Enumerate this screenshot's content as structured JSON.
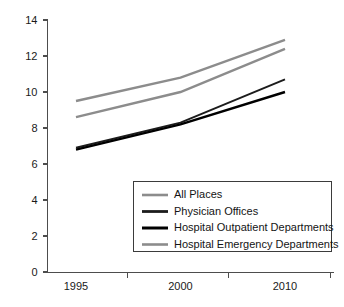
{
  "chart_data": {
    "type": "line",
    "title": "",
    "subtitle": "",
    "xlabel": "",
    "ylabel": "",
    "x": [
      "1995",
      "2000",
      "2010"
    ],
    "categories": [
      "1995",
      "2000",
      "2010"
    ],
    "xtick_labels": [
      "1995",
      "2000",
      "2010"
    ],
    "ytick_labels": [
      "0",
      "2",
      "4",
      "6",
      "8",
      "10",
      "12",
      "14"
    ],
    "ytick_values": [
      0,
      2,
      4,
      6,
      8,
      10,
      12,
      14
    ],
    "ylim": [
      0,
      14
    ],
    "grid": false,
    "legend_position": "lower-right-inside",
    "series": [
      {
        "name": "All Places",
        "values": [
          9.5,
          10.8,
          12.9
        ],
        "color": "#8c8c8c",
        "width": 2.4
      },
      {
        "name": "Physician Offices",
        "values": [
          6.9,
          8.3,
          10.7
        ],
        "color": "#1c1c1c",
        "width": 2.0
      },
      {
        "name": "Hospital Outpatient Departments",
        "values": [
          6.8,
          8.2,
          10.0
        ],
        "color": "#000000",
        "width": 2.4
      },
      {
        "name": "Hospital Emergency Departments",
        "values": [
          8.6,
          10.0,
          12.4
        ],
        "color": "#8c8c8c",
        "width": 2.4
      }
    ],
    "legend_entries": [
      {
        "label": "All Places",
        "color": "#8c8c8c",
        "width": 2.6
      },
      {
        "label": "Physician Offices",
        "color": "#1c1c1c",
        "width": 2.8
      },
      {
        "label": "Hospital Outpatient Departments",
        "color": "#000000",
        "width": 3.0
      },
      {
        "label": "Hospital Emergency Departments",
        "color": "#8c8c8c",
        "width": 2.6
      }
    ],
    "axis_color": "#4d4d4d",
    "background": "#ffffff"
  }
}
